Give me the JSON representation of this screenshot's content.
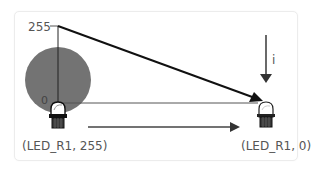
{
  "diagram": {
    "axis": {
      "max_label": "255",
      "min_label": "0"
    },
    "current_label": "i",
    "start_state": {
      "caption": "(LED_R1, 255)",
      "device": "LED_R1",
      "brightness": 255,
      "icon": "led-on-icon",
      "glow_color": "#737373"
    },
    "end_state": {
      "caption": "(LED_R1, 0)",
      "device": "LED_R1",
      "brightness": 0,
      "icon": "led-off-icon"
    },
    "colors": {
      "line": "#111111",
      "axis": "#333333",
      "arrow": "#3a3a3a",
      "glow": "#737373",
      "card_border": "#ececec"
    }
  }
}
